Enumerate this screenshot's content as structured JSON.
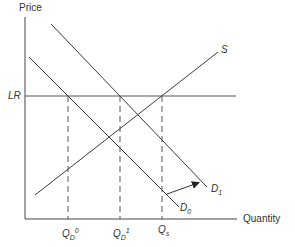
{
  "diagram": {
    "type": "supply-demand",
    "axes": {
      "y_label": "Price",
      "x_label": "Quantity"
    },
    "horizontal_line": {
      "label": "LR"
    },
    "curves": {
      "supply": {
        "label": "S"
      },
      "demand_initial": {
        "label_main": "D",
        "label_sub": "0"
      },
      "demand_shifted": {
        "label_main": "D",
        "label_sub": "1"
      }
    },
    "quantity_markers": [
      {
        "main": "Q",
        "sub": "D",
        "sup": "0"
      },
      {
        "main": "Q",
        "sub": "D",
        "sup": "1"
      },
      {
        "main": "Q",
        "sub": "s",
        "sup": ""
      }
    ],
    "annotation": {
      "arrow": "shift from D0 to D1"
    },
    "colors": {
      "line": "#3a3a3a",
      "text": "#333333",
      "background": "#ffffff"
    }
  }
}
